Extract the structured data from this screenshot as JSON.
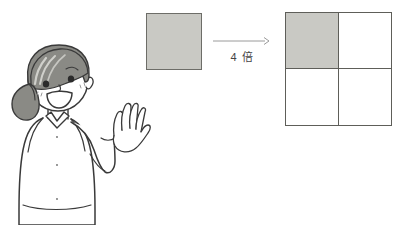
{
  "canvas": {
    "width": 413,
    "height": 225,
    "background_color": "#ffffff"
  },
  "colors": {
    "shaded_fill": "#c9c9c4",
    "square_stroke": "#6d6d68",
    "grid_stroke": "#5e5e59",
    "line_art": "#3a3a3a",
    "hair_fill": "#8a8a85",
    "hair_highlight": "#b9b9b4",
    "text": "#444444",
    "arrow": "#9a9a9a"
  },
  "illustration": {
    "subject": "smiling girl with ponytail raising one open hand",
    "parts": {
      "hair": "ponytail-hair",
      "face": "smiling-face",
      "eyes": "eyes",
      "mouth": "open-smile-mouth",
      "cheeks": "blush-marks",
      "hand": "raised-open-hand",
      "arm": "raised-arm",
      "body": "collared-shirt-torso"
    }
  },
  "diagram": {
    "small_square": {
      "label": "unit-square",
      "fill": "shaded",
      "rows": 1,
      "columns": 1,
      "shaded_cells": 1,
      "total_cells": 1
    },
    "arrow": {
      "direction": "right",
      "label": "4 倍"
    },
    "big_square": {
      "label": "four-times-square",
      "rows": 2,
      "columns": 2,
      "total_cells": 4,
      "shaded_cells": 1,
      "cells": [
        {
          "position": "top-left",
          "shaded": true
        },
        {
          "position": "top-right",
          "shaded": false
        },
        {
          "position": "bottom-left",
          "shaded": false
        },
        {
          "position": "bottom-right",
          "shaded": false
        }
      ]
    }
  }
}
